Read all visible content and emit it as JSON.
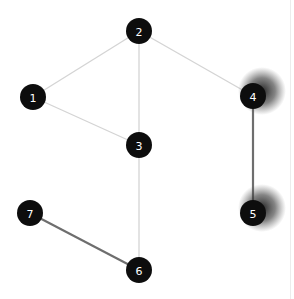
{
  "graph": {
    "nodes": [
      {
        "id": "1",
        "label": "1",
        "x": 33,
        "y": 97,
        "highlight": false
      },
      {
        "id": "2",
        "label": "2",
        "x": 139,
        "y": 31,
        "highlight": false
      },
      {
        "id": "3",
        "label": "3",
        "x": 139,
        "y": 145,
        "highlight": false
      },
      {
        "id": "4",
        "label": "4",
        "x": 253,
        "y": 96,
        "highlight": true
      },
      {
        "id": "5",
        "label": "5",
        "x": 253,
        "y": 213,
        "highlight": true
      },
      {
        "id": "6",
        "label": "6",
        "x": 139,
        "y": 270,
        "highlight": false
      },
      {
        "id": "7",
        "label": "7",
        "x": 30,
        "y": 213,
        "highlight": false
      }
    ],
    "edges": [
      {
        "from": "1",
        "to": "2",
        "style": "light"
      },
      {
        "from": "2",
        "to": "3",
        "style": "light"
      },
      {
        "from": "2",
        "to": "4",
        "style": "light"
      },
      {
        "from": "1",
        "to": "3",
        "style": "light"
      },
      {
        "from": "3",
        "to": "6",
        "style": "light"
      },
      {
        "from": "4",
        "to": "5",
        "style": "dark"
      },
      {
        "from": "7",
        "to": "6",
        "style": "dark"
      }
    ],
    "colors": {
      "node_fill": "#0d0d0d",
      "node_text": "#ffffff",
      "edge_light": "#d4d4d4",
      "edge_dark": "#6e6e6e",
      "glow": "#222222"
    }
  }
}
